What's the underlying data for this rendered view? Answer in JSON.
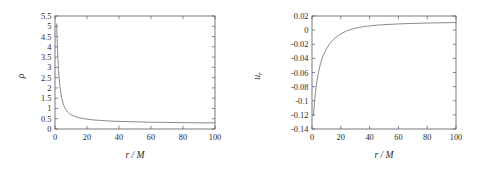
{
  "figure": {
    "background_color": "#ffffff",
    "axis_color": "#58585a",
    "curve_color": "#6d6d70",
    "panel_count": 2
  },
  "chart_data": [
    {
      "type": "line",
      "panel": "left",
      "title": "",
      "xlabel": "r / M",
      "ylabel": "ρ",
      "xlim": [
        0,
        100
      ],
      "ylim": [
        0,
        5.5
      ],
      "xticks": [
        0,
        20,
        40,
        60,
        80,
        100
      ],
      "xtick_labels": [
        "0",
        "20",
        "40",
        "60",
        "80",
        "100"
      ],
      "yticks": [
        0,
        0.5,
        1,
        1.5,
        2,
        2.5,
        3,
        3.5,
        4,
        4.5,
        5,
        5.5
      ],
      "ytick_labels": [
        "0",
        "0.5",
        "1",
        "1.5",
        "2",
        "2.5",
        "3",
        "3.5",
        "4",
        "4.5",
        "5",
        "5.5"
      ],
      "grid": false,
      "legend": "none",
      "x": [
        1.0,
        1.4,
        1.8,
        2.2,
        2.6,
        3.0,
        3.6,
        4.2,
        5.0,
        6.0,
        7.0,
        8.0,
        9.0,
        10.0,
        12.0,
        14.0,
        16.0,
        18.0,
        20.0,
        24.0,
        28.0,
        32.0,
        36.0,
        40.0,
        50.0,
        60.0,
        70.0,
        80.0,
        90.0,
        100.0
      ],
      "y": [
        5.12,
        4.2,
        3.45,
        2.88,
        2.45,
        2.12,
        1.76,
        1.5,
        1.26,
        1.05,
        0.92,
        0.82,
        0.75,
        0.7,
        0.62,
        0.57,
        0.53,
        0.5,
        0.48,
        0.44,
        0.42,
        0.4,
        0.38,
        0.37,
        0.35,
        0.33,
        0.32,
        0.31,
        0.3,
        0.3
      ]
    },
    {
      "type": "line",
      "panel": "right",
      "title": "",
      "xlabel": "r / M",
      "ylabel": "u_r",
      "ylabel_base": "u",
      "ylabel_subscript": "r",
      "xlim": [
        0,
        100
      ],
      "ylim": [
        -0.14,
        0.02
      ],
      "xticks": [
        0,
        20,
        40,
        60,
        80,
        100
      ],
      "xtick_labels": [
        "0",
        "20",
        "40",
        "60",
        "80",
        "100"
      ],
      "yticks": [
        -0.14,
        -0.12,
        -0.1,
        -0.08,
        -0.06,
        -0.04,
        -0.02,
        0,
        0.02
      ],
      "ytick_labels": [
        "-0.14",
        "-0.12",
        "-0.1",
        "-0.08",
        "-0.06",
        "-0.04",
        "-0.02",
        "0",
        "0.02"
      ],
      "grid": false,
      "legend": "none",
      "x": [
        1.0,
        1.5,
        2.0,
        2.6,
        3.2,
        4.0,
        5.0,
        6.0,
        7.0,
        8.0,
        9.0,
        10.0,
        12.0,
        14.0,
        16.0,
        18.0,
        20.0,
        24.0,
        28.0,
        32.0,
        36.0,
        40.0,
        45.0,
        50.0,
        60.0,
        70.0,
        80.0,
        90.0,
        100.0
      ],
      "y": [
        -0.1215,
        -0.1075,
        -0.096,
        -0.0845,
        -0.075,
        -0.065,
        -0.055,
        -0.047,
        -0.0405,
        -0.035,
        -0.0305,
        -0.0265,
        -0.02,
        -0.015,
        -0.0112,
        -0.008,
        -0.0053,
        -0.0012,
        0.0015,
        0.0035,
        0.005,
        0.006,
        0.007,
        0.0077,
        0.0088,
        0.0095,
        0.01,
        0.0104,
        0.0107
      ]
    }
  ]
}
